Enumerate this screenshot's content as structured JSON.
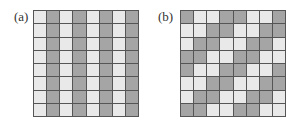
{
  "panels": [
    {
      "label": "(a)",
      "rows": [
        "LDLDLDLD",
        "LDLDLDLD",
        "LDLDLDLD",
        "LDLDLDLD",
        "LDLDLDLD",
        "LDLDLDLD",
        "LDLDLDLD",
        "LDLDLDLD"
      ]
    },
    {
      "label": "(b)",
      "rows": [
        "DLLDDLLD",
        "LLDDLLDD",
        "LDDLLDDL",
        "DDLLDDLL",
        "DLLDDLLD",
        "LLDDLLDD",
        "LDDLLDDL",
        "DDLLDDLL"
      ]
    }
  ],
  "colors": {
    "light": "#e9e9e9",
    "dark": "#a5a5a5",
    "gridline": "#555555"
  }
}
